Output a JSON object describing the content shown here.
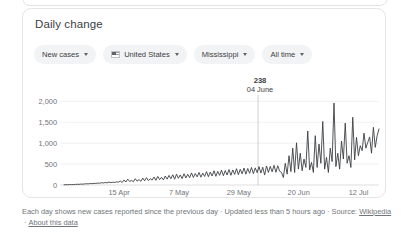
{
  "card": {
    "title": "Daily change"
  },
  "filters": [
    {
      "name": "metric",
      "label": "New cases",
      "icon": null
    },
    {
      "name": "country",
      "label": "United States",
      "icon": "us-flag-icon"
    },
    {
      "name": "region",
      "label": "Mississippi",
      "icon": null
    },
    {
      "name": "range",
      "label": "All time",
      "icon": null
    }
  ],
  "annotation": {
    "value": "238",
    "date": "04 June"
  },
  "footer": {
    "description": "Each day shows new cases reported since the previous day",
    "updated": "Updated less than 5 hours ago",
    "source_label": "Source:",
    "source_link": "Wikipedia",
    "about_link": "About this data",
    "separator": "·"
  },
  "chart_data": {
    "type": "line",
    "title": "Daily change",
    "xlabel": "",
    "ylabel": "",
    "grid": true,
    "legend": "none",
    "line_color": "#3c4043",
    "ylim": [
      0,
      2200
    ],
    "yticks": [
      0,
      500,
      1000,
      1500,
      2000
    ],
    "ytick_labels": [
      "0",
      "500",
      "1,000",
      "1,500",
      "2,000"
    ],
    "xticks": [
      "15 Apr",
      "7 May",
      "29 May",
      "20 Jun",
      "12 Jul"
    ],
    "xtick_positions": [
      0.175,
      0.365,
      0.555,
      0.745,
      0.935
    ],
    "marker": {
      "x_fraction": 0.616,
      "label": "04 June",
      "value": 238
    },
    "values": [
      5,
      8,
      6,
      12,
      10,
      9,
      14,
      18,
      15,
      22,
      20,
      26,
      30,
      28,
      35,
      32,
      40,
      38,
      46,
      42,
      55,
      48,
      60,
      52,
      70,
      58,
      66,
      62,
      75,
      68,
      95,
      60,
      120,
      72,
      140,
      85,
      110,
      78,
      150,
      92,
      130,
      88,
      165,
      100,
      175,
      105,
      150,
      118,
      190,
      112,
      205,
      130,
      185,
      122,
      215,
      140,
      230,
      150,
      245,
      138,
      260,
      160,
      240,
      152,
      270,
      168,
      255,
      175,
      290,
      180,
      275,
      195,
      300,
      188,
      285,
      205,
      320,
      198,
      310,
      215,
      340,
      208,
      325,
      230,
      355,
      222,
      345,
      240,
      370,
      232,
      360,
      255,
      390,
      248,
      375,
      268,
      405,
      260,
      395,
      280,
      420,
      272,
      410,
      295,
      440,
      285,
      425,
      238,
      455,
      300,
      445,
      315,
      470,
      305,
      460,
      330,
      300,
      180,
      520,
      260,
      700,
      320,
      880,
      300,
      1010,
      380,
      760,
      340,
      620,
      420,
      1290,
      360,
      540,
      300,
      1180,
      420,
      980,
      520,
      1520,
      380,
      660,
      300,
      880,
      560,
      1960,
      440,
      760,
      380,
      1050,
      620,
      1480,
      520,
      700,
      420,
      1620,
      600,
      1140,
      700,
      940,
      820,
      1240,
      880,
      1020,
      1150,
      760,
      1380,
      900,
      1180,
      1340
    ]
  }
}
